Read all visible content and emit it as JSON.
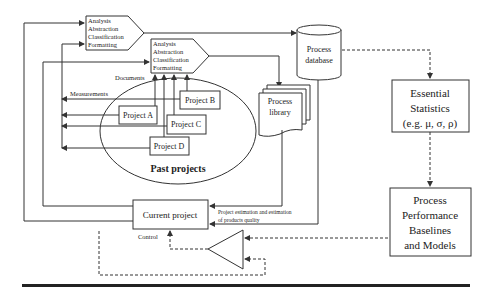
{
  "diagram": {
    "analysis_box_1": {
      "lines": [
        "Analysis",
        "Abstraction",
        "Classification",
        "Formatting"
      ]
    },
    "analysis_box_2": {
      "lines": [
        "Analysis",
        "Abstraction",
        "Classification",
        "Formatting"
      ]
    },
    "process_database": {
      "lines": [
        "Process",
        "database"
      ]
    },
    "process_library": {
      "lines": [
        "Process",
        "library"
      ]
    },
    "essential_statistics": {
      "lines": [
        "Essential",
        "Statistics",
        "(e.g. μ, σ, ρ)"
      ]
    },
    "baselines": {
      "lines": [
        "Process",
        "Performance",
        "Baselines",
        "and Models"
      ]
    },
    "past_projects": {
      "title": "Past projects",
      "projects": [
        "Project A",
        "Project B",
        "Project C",
        "Project D"
      ]
    },
    "current_project": {
      "label": "Current project"
    },
    "labels": {
      "documents": "Documents",
      "measurements": "Measurements",
      "control": "Control",
      "estimation_line1": "Project estimation and estimation",
      "estimation_line2": "of products quality"
    }
  }
}
